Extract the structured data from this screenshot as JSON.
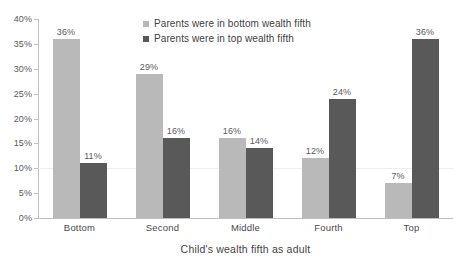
{
  "chart_data": {
    "type": "bar",
    "title": "",
    "xlabel": "Child's wealth fifth as adult",
    "ylabel": "",
    "categories": [
      "Bottom",
      "Second",
      "Middle",
      "Fourth",
      "Top"
    ],
    "series": [
      {
        "name": "Parents were in bottom wealth fifth",
        "color": "#b9b9b9",
        "values": [
          36,
          29,
          16,
          12,
          7
        ],
        "labels": [
          "36%",
          "29%",
          "16%",
          "12%",
          "7%"
        ]
      },
      {
        "name": "Parents were in top wealth fifth",
        "color": "#595959",
        "values": [
          11,
          16,
          14,
          24,
          36
        ],
        "labels": [
          "11%",
          "16%",
          "14%",
          "24%",
          "36%"
        ]
      }
    ],
    "ylim": [
      0,
      40
    ],
    "yticks": [
      0,
      5,
      10,
      15,
      20,
      25,
      30,
      35,
      40
    ],
    "ytick_labels": [
      "0%",
      "5%",
      "10%",
      "15%",
      "20%",
      "25%",
      "30%",
      "35%",
      "40%"
    ],
    "grid": "single faint horizontal gridline at 10%",
    "gridlines_at": [
      10
    ],
    "legend_position": "top-center inside plot area",
    "value_unit": "%"
  },
  "caption": {
    "cropped_text": ""
  }
}
